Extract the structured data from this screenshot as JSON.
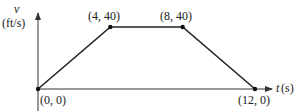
{
  "chart_data": {
    "type": "line",
    "title": "",
    "xlabel": "t(s)",
    "ylabel": "v (ft/s)",
    "ylabel_var": "v",
    "ylabel_unit": "(ft/s)",
    "xlabel_var": "t",
    "xlabel_unit": "(s)",
    "x": [
      0,
      4,
      8,
      12
    ],
    "series": [
      {
        "name": "velocity",
        "values": [
          0,
          40,
          40,
          0
        ]
      }
    ],
    "point_labels": [
      "(0, 0)",
      "(4, 40)",
      "(8, 40)",
      "(12, 0)"
    ],
    "xlim": [
      0,
      12
    ],
    "ylim": [
      0,
      40
    ],
    "grid": false,
    "legend": "none",
    "colors": {
      "line": "#222222",
      "axis": "#333333"
    }
  }
}
